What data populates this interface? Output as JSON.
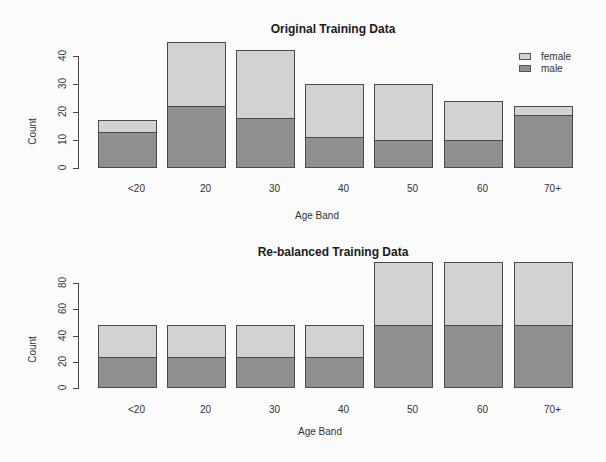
{
  "colors": {
    "female": "#d2d2d2",
    "male": "#8f8f8f",
    "border": "#4a4a4a"
  },
  "chart_data": [
    {
      "type": "bar",
      "stacked": true,
      "title": "Original Training Data",
      "xlabel": "Age Band",
      "ylabel": "Count",
      "categories": [
        "<20",
        "20",
        "30",
        "40",
        "50",
        "60",
        "70+"
      ],
      "series": [
        {
          "name": "male",
          "values": [
            13,
            22,
            18,
            11,
            10,
            10,
            19
          ]
        },
        {
          "name": "female",
          "values": [
            4,
            23,
            24,
            19,
            20,
            14,
            3
          ]
        }
      ],
      "yticks": [
        0,
        10,
        20,
        30,
        40
      ],
      "ylim": [
        0,
        45
      ],
      "legend": {
        "position": "top-right",
        "entries": [
          "female",
          "male"
        ]
      },
      "grid": false
    },
    {
      "type": "bar",
      "stacked": true,
      "title": "Re-balanced Training Data",
      "xlabel": "Age Band",
      "ylabel": "Count",
      "categories": [
        "<20",
        "20",
        "30",
        "40",
        "50",
        "60",
        "70+"
      ],
      "series": [
        {
          "name": "male",
          "values": [
            24,
            24,
            24,
            24,
            48,
            48,
            48
          ]
        },
        {
          "name": "female",
          "values": [
            24,
            24,
            24,
            24,
            48,
            48,
            48
          ]
        }
      ],
      "yticks": [
        0,
        20,
        40,
        60,
        80
      ],
      "ylim": [
        0,
        96
      ],
      "legend": null,
      "grid": false
    }
  ],
  "legend": {
    "female": "female",
    "male": "male"
  }
}
